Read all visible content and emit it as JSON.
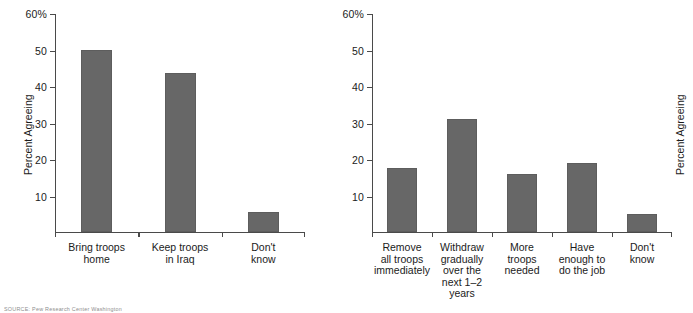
{
  "figure": {
    "source_note": "SOURCE: Pew Research Center Washington"
  },
  "chart_data": [
    {
      "type": "bar",
      "panel": "left",
      "title": "",
      "xlabel": "",
      "ylabel": "Percent Agreeing",
      "categories": [
        "Bring troops\nhome",
        "Keep troops\nin Iraq",
        "Don't\nknow"
      ],
      "values": [
        50,
        43.5,
        5.5
      ],
      "ylim": [
        0,
        60
      ],
      "yticks": [
        10,
        20,
        30,
        40,
        50,
        60
      ],
      "ytick_labels": [
        "10",
        "20",
        "30",
        "40",
        "50",
        "60%"
      ],
      "grid": false,
      "legend": null
    },
    {
      "type": "bar",
      "panel": "right",
      "title": "",
      "xlabel": "",
      "ylabel": "Percent Agreeing",
      "categories": [
        "Remove\nall troops\nimmediately",
        "Withdraw\ngradually\nover the\nnext 1–2\nyears",
        "More\ntroops\nneeded",
        "Have\nenough to\ndo the job",
        "Don't\nknow"
      ],
      "values": [
        17.5,
        31,
        16,
        19,
        5
      ],
      "ylim": [
        0,
        60
      ],
      "yticks": [
        10,
        20,
        30,
        40,
        50,
        60
      ],
      "ytick_labels": [
        "10",
        "20",
        "30",
        "40",
        "50",
        "60%"
      ],
      "grid": false,
      "legend": null
    }
  ],
  "style": {
    "bar_color": "#676767",
    "axis_color": "#4a4a4a",
    "text_color": "#1b1b1b",
    "background": "#ffffff"
  }
}
